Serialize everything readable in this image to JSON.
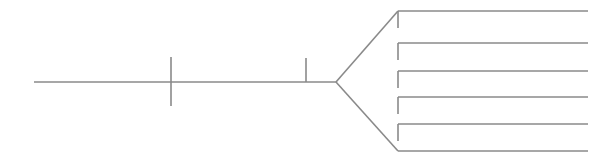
{
  "canvas": {
    "width": 615,
    "height": 159,
    "background": "#ffffff"
  },
  "diagram": {
    "kind": "fishbone-skeleton",
    "title": "",
    "stroke_color": "#8a8a8a",
    "stroke_width": 1.6,
    "spine": {
      "label": "",
      "x1": 34,
      "y1": 82,
      "x2": 336,
      "y2": 82
    },
    "spine_ticks": [
      {
        "name": "spine-tick-1",
        "label": "",
        "x": 171,
        "y1": 57,
        "y2": 106
      },
      {
        "name": "spine-tick-2",
        "label": "",
        "x": 306,
        "y1": 58,
        "y2": 82
      }
    ],
    "wedge": {
      "label": "",
      "vertex_x": 336,
      "vertex_y": 82,
      "top_x": 398,
      "top_y": 11,
      "bottom_x": 398,
      "bottom_y": 151
    },
    "branches": [
      {
        "name": "branch-1",
        "label": "",
        "x1": 398,
        "y1": 11,
        "x2": 588,
        "y2": 11,
        "stub_y2": 28
      },
      {
        "name": "branch-2",
        "label": "",
        "x1": 398,
        "y1": 43,
        "x2": 588,
        "y2": 43,
        "stub_y2": 60
      },
      {
        "name": "branch-3",
        "label": "",
        "x1": 398,
        "y1": 71,
        "x2": 588,
        "y2": 71,
        "stub_y2": 88
      },
      {
        "name": "branch-4",
        "label": "",
        "x1": 398,
        "y1": 97,
        "x2": 588,
        "y2": 97,
        "stub_y2": 114
      },
      {
        "name": "branch-5",
        "label": "",
        "x1": 398,
        "y1": 124,
        "x2": 588,
        "y2": 124,
        "stub_y2": 141
      },
      {
        "name": "branch-6",
        "label": "",
        "x1": 398,
        "y1": 151,
        "x2": 588,
        "y2": 151,
        "stub_y2": 151
      }
    ]
  }
}
